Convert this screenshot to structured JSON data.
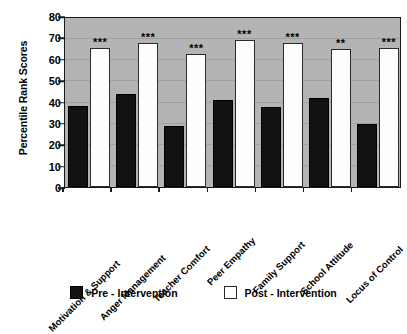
{
  "chart_data": {
    "type": "bar",
    "title": "",
    "subtitle": "",
    "xlabel": "",
    "ylabel": "Percentile Rank Scores",
    "ylim": [
      0,
      80
    ],
    "y_ticks": [
      0,
      10,
      20,
      30,
      40,
      50,
      60,
      70,
      80
    ],
    "grid": true,
    "legend_position": "bottom",
    "plot_background_color": "#b4b4b4",
    "categories": [
      "Motivation & Support",
      "Anger Management",
      "Teacher Comfort",
      "Peer Empathy",
      "Family Support",
      "School Attitude",
      "Locus of Control"
    ],
    "series": [
      {
        "name": "Pre - Intervention",
        "color": "#121212",
        "values": [
          38.5,
          44,
          29,
          41,
          38,
          42,
          30
        ]
      },
      {
        "name": "Post - Intervention",
        "color": "#ffffff",
        "values": [
          66,
          68,
          63,
          69.5,
          68,
          65.5,
          66
        ]
      }
    ],
    "annotations": [
      {
        "category": "Motivation & Support",
        "marker": "***"
      },
      {
        "category": "Anger Management",
        "marker": "***"
      },
      {
        "category": "Teacher Comfort",
        "marker": "***"
      },
      {
        "category": "Peer Empathy",
        "marker": "***"
      },
      {
        "category": "Family Support",
        "marker": "***"
      },
      {
        "category": "School Attitude",
        "marker": "**"
      },
      {
        "category": "Locus of Control",
        "marker": "***"
      }
    ]
  },
  "axis": {
    "y_title": "Percentile Rank Scores",
    "y_tick_labels": [
      "80",
      "70",
      "60",
      "50",
      "40",
      "30",
      "20",
      "10",
      "0"
    ]
  },
  "legend": {
    "entries": [
      {
        "label": "Pre - Intervention",
        "swatch": "filled-black-square"
      },
      {
        "label": "Post - Intervention",
        "swatch": "outlined-white-square"
      }
    ]
  }
}
